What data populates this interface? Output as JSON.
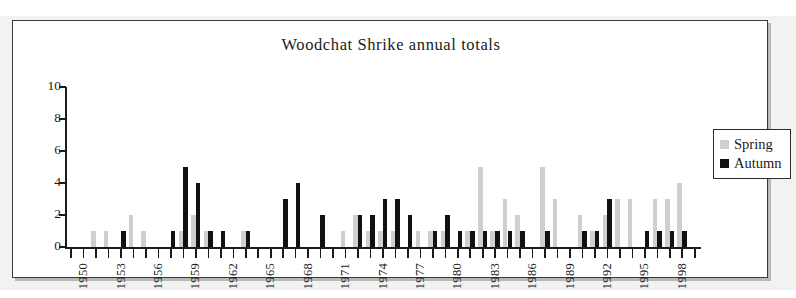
{
  "figure": {
    "background_color": "#f2f2f2",
    "plate_background": "#ffffff",
    "border_color": "#3a3a3a"
  },
  "legend": {
    "position": "right",
    "entries": [
      {
        "label": "Spring",
        "color": "#cfcfcf"
      },
      {
        "label": "Autumn",
        "color": "#111111"
      }
    ]
  },
  "chart_data": {
    "type": "bar",
    "title": "Woodchat Shrike annual totals",
    "xlabel": "",
    "ylabel": "",
    "ylim": [
      0,
      10
    ],
    "yticks": [
      0,
      2,
      4,
      6,
      8,
      10
    ],
    "grid": false,
    "legend_position": "right",
    "bar_mode": "grouped",
    "categories": [
      "1950",
      "1951",
      "1952",
      "1953",
      "1954",
      "1955",
      "1956",
      "1957",
      "1958",
      "1959",
      "1960",
      "1961",
      "1962",
      "1963",
      "1964",
      "1965",
      "1966",
      "1967",
      "1968",
      "1969",
      "1970",
      "1971",
      "1972",
      "1973",
      "1974",
      "1975",
      "1976",
      "1977",
      "1978",
      "1979",
      "1980",
      "1981",
      "1982",
      "1983",
      "1984",
      "1985",
      "1986",
      "1987",
      "1988",
      "1989",
      "1990",
      "1991",
      "1992",
      "1993",
      "1994",
      "1995",
      "1996",
      "1997",
      "1998",
      "1999",
      "2000"
    ],
    "xtick_labels": [
      "1950",
      "1953",
      "1956",
      "1959",
      "1962",
      "1965",
      "1968",
      "1971",
      "1974",
      "1977",
      "1980",
      "1983",
      "1986",
      "1989",
      "1992",
      "1995",
      "1998"
    ],
    "xtick_label_rotation": -90,
    "xtick_label_interval_years": 3,
    "series": [
      {
        "name": "Spring",
        "color": "#cfcfcf",
        "values": [
          0,
          0,
          1,
          1,
          0,
          2,
          1,
          0,
          0,
          1,
          2,
          1,
          0,
          0,
          1,
          0,
          0,
          0,
          0,
          0,
          0,
          0,
          1,
          2,
          1,
          1,
          1,
          0,
          1,
          1,
          1,
          0,
          1,
          5,
          1,
          3,
          2,
          0,
          5,
          3,
          0,
          2,
          1,
          2,
          3,
          3,
          0,
          3,
          3,
          4,
          0
        ]
      },
      {
        "name": "Autumn",
        "color": "#111111",
        "values": [
          0,
          0,
          0,
          0,
          1,
          0,
          0,
          0,
          1,
          5,
          4,
          1,
          1,
          0,
          1,
          0,
          0,
          3,
          4,
          0,
          2,
          0,
          0,
          2,
          2,
          3,
          3,
          2,
          0,
          1,
          2,
          1,
          1,
          1,
          1,
          1,
          1,
          0,
          1,
          0,
          0,
          1,
          1,
          3,
          0,
          0,
          1,
          1,
          1,
          1,
          0
        ]
      }
    ]
  }
}
